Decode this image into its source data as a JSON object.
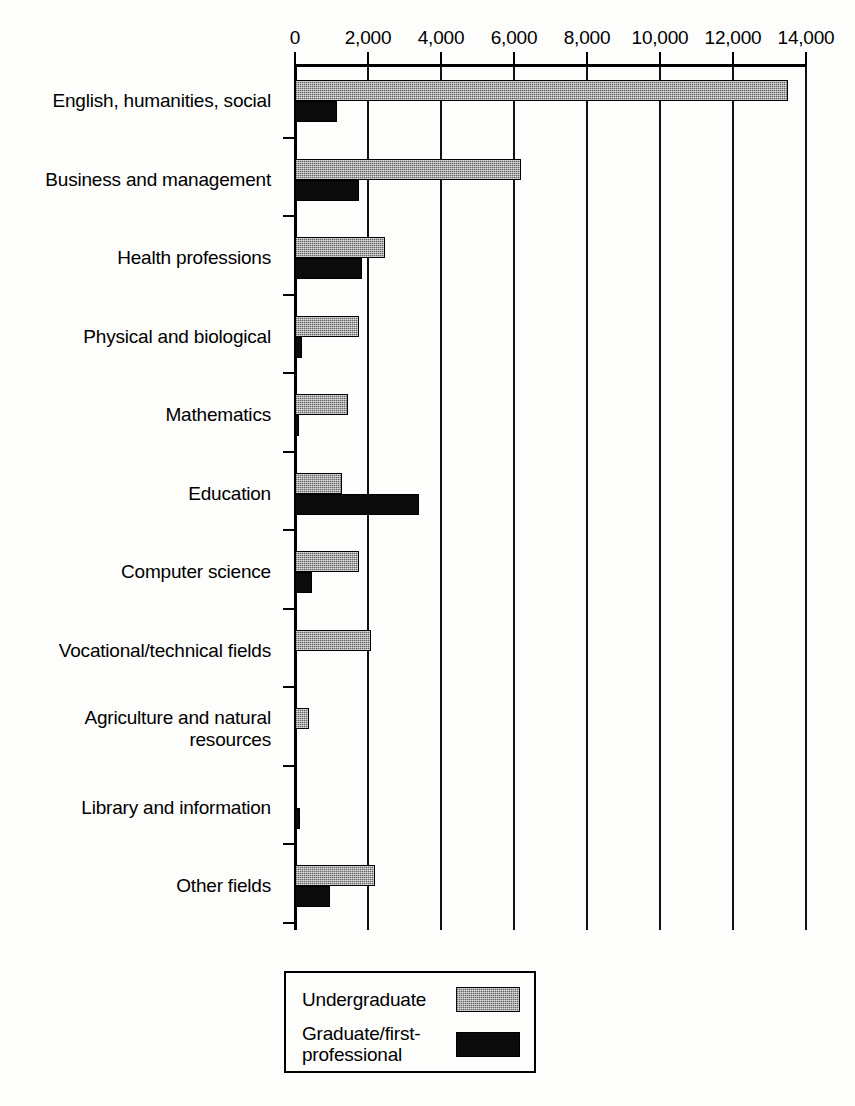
{
  "chart_data": {
    "type": "bar",
    "orientation": "horizontal",
    "title": "",
    "subtitle": "",
    "xlabel": "",
    "ylabel": "",
    "xlim": [
      0,
      14000
    ],
    "xticks": [
      0,
      2000,
      4000,
      6000,
      8000,
      10000,
      12000,
      14000
    ],
    "xtick_labels": [
      "0",
      "2,000",
      "4,000",
      "6,000",
      "8,000",
      "10,000",
      "12,000",
      "14,000"
    ],
    "grid": true,
    "grid_axis": "x",
    "axis_position": "top",
    "legend_position": "bottom",
    "categories": [
      "English, humanities, social",
      "Business and management",
      "Health professions",
      "Physical and biological",
      "Mathematics",
      "Education",
      "Computer science",
      "Vocational/technical fields",
      "Agriculture and natural\nresources",
      "Library and information",
      "Other fields"
    ],
    "series": [
      {
        "name": "Undergraduate",
        "color": "#8f8f8f",
        "values": [
          13500,
          6200,
          2470,
          1740,
          1460,
          1300,
          1740,
          2090,
          390,
          60,
          2180
        ]
      },
      {
        "name": "Graduate/first-\nprofessional",
        "color": "#0b0b0b",
        "values": [
          1150,
          1760,
          1840,
          190,
          110,
          3390,
          460,
          0,
          0,
          140,
          950
        ]
      }
    ]
  },
  "legend": {
    "entries": [
      {
        "label": "Undergraduate",
        "swatch": "undergrad"
      },
      {
        "label": "Graduate/first-\nprofessional",
        "swatch": "grad"
      }
    ]
  }
}
